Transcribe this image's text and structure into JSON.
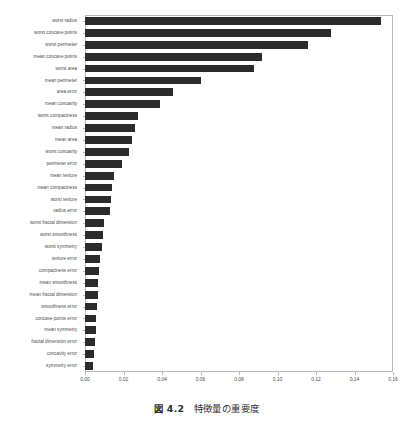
{
  "caption": {
    "figure_number": "図 4.2",
    "text": "特徴量の重要度"
  },
  "chart_data": {
    "type": "bar",
    "orientation": "horizontal",
    "title": "",
    "xlabel": "",
    "ylabel": "",
    "xlim": [
      0.0,
      0.16
    ],
    "ylim": [
      0,
      30
    ],
    "grid": false,
    "legend": null,
    "bar_color": "#2b2b2b",
    "xticks": [
      0.0,
      0.02,
      0.04,
      0.06,
      0.08,
      0.1,
      0.12,
      0.14,
      0.16
    ],
    "xticklabels": [
      "0.00",
      "0.02",
      "0.04",
      "0.06",
      "0.08",
      "0.10",
      "0.12",
      "0.14",
      "0.16"
    ],
    "categories": [
      "worst radius",
      "worst concave points",
      "worst perimeter",
      "mean concave points",
      "worst area",
      "mean perimeter",
      "area error",
      "mean concavity",
      "worst compactness",
      "mean radius",
      "mean area",
      "worst concavity",
      "perimeter error",
      "mean texture",
      "mean compactness",
      "worst texture",
      "radius error",
      "worst fractal dimension",
      "worst smoothness",
      "worst symmetry",
      "texture error",
      "compactness error",
      "mean smoothness",
      "mean fractal dimension",
      "smoothness error",
      "concave points error",
      "mean symmetry",
      "fractal dimension error",
      "concavity error",
      "symmetry error"
    ],
    "values": [
      0.154,
      0.1278,
      0.116,
      0.092,
      0.088,
      0.06,
      0.0455,
      0.039,
      0.0275,
      0.0258,
      0.0243,
      0.0228,
      0.019,
      0.015,
      0.0142,
      0.0136,
      0.0128,
      0.01,
      0.0092,
      0.0086,
      0.008,
      0.0073,
      0.007,
      0.0065,
      0.0062,
      0.0058,
      0.0055,
      0.0052,
      0.0048,
      0.0042
    ]
  }
}
